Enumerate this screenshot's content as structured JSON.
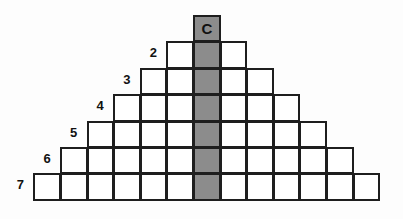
{
  "diagram": {
    "type": "pyramid-grid",
    "center_column_label": "C",
    "colors": {
      "cell_fill": "#ffffff",
      "center_fill": "#8c8c8c",
      "border": "#1e1e1e"
    },
    "rows": [
      {
        "row": 1,
        "label": "",
        "cells": 1
      },
      {
        "row": 2,
        "label": "2",
        "cells": 3
      },
      {
        "row": 3,
        "label": "3",
        "cells": 5
      },
      {
        "row": 4,
        "label": "4",
        "cells": 7
      },
      {
        "row": 5,
        "label": "5",
        "cells": 9
      },
      {
        "row": 6,
        "label": "6",
        "cells": 11
      },
      {
        "row": 7,
        "label": "7",
        "cells": 13
      }
    ]
  }
}
